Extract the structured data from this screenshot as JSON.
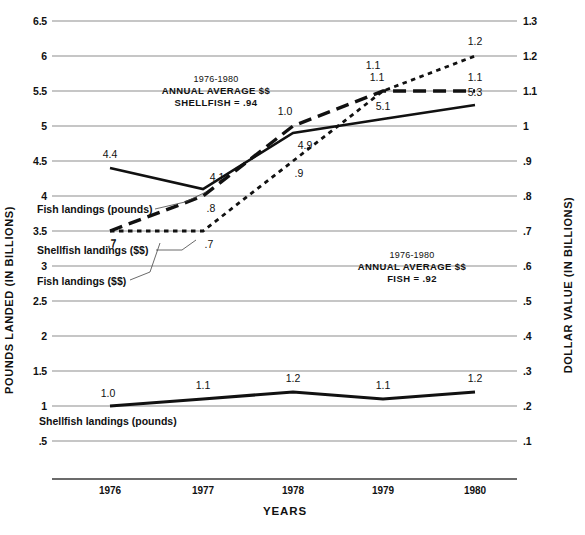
{
  "chart_data": {
    "type": "line",
    "title": "",
    "xlabel": "YEARS",
    "ylabel": "POUNDS LANDED (IN BILLIONS)",
    "ylabel_right": "DOLLAR VALUE (IN BILLIONS)",
    "categories": [
      "1976",
      "1977",
      "1978",
      "1979",
      "1980"
    ],
    "x": [
      1976,
      1977,
      1978,
      1979,
      1980
    ],
    "ylim": [
      0.5,
      6.5
    ],
    "ylim_right": [
      0.1,
      1.3
    ],
    "grid": true,
    "legend": "inline-callouts",
    "yticks_left": [
      "6.5",
      "6",
      "5.5",
      "5",
      "4.5",
      "4",
      "3.5",
      "3",
      "2.5",
      "2",
      "1.5",
      "1",
      ".5"
    ],
    "yticks_right": [
      "1.3",
      "1.2",
      "1.1",
      "1",
      ".9",
      ".8",
      ".7",
      ".6",
      ".5",
      ".4",
      ".3",
      ".2",
      ".1"
    ],
    "series": [
      {
        "name": "Fish landings (pounds)",
        "axis": "left",
        "style": "solid",
        "values": [
          4.4,
          4.1,
          4.9,
          5.1,
          5.3
        ],
        "labels": [
          "4.4",
          "4.1",
          "4.9",
          "5.1",
          "5.3"
        ]
      },
      {
        "name": "Shellfish landings ($$)",
        "axis": "right",
        "style": "long-dash",
        "values": [
          0.7,
          0.8,
          1.0,
          1.1,
          1.1
        ],
        "labels": [
          ".7",
          ".8",
          "1.0",
          "1.1",
          "1.1"
        ]
      },
      {
        "name": "Fish landings ($$)",
        "axis": "right",
        "style": "short-dash",
        "values": [
          0.7,
          0.7,
          0.9,
          1.1,
          1.2
        ],
        "labels": [
          ".7",
          ".7",
          ".9",
          "1.1",
          "1.2"
        ]
      },
      {
        "name": "Shellfish landings (pounds)",
        "axis": "left",
        "style": "solid-thick",
        "values": [
          1.0,
          1.1,
          1.2,
          1.1,
          1.2
        ],
        "labels": [
          "1.0",
          "1.1",
          "1.2",
          "1.1",
          "1.2"
        ]
      }
    ],
    "annotations": [
      {
        "id": "shellfish-average",
        "line1": "1976-1980",
        "line2": "ANNUAL AVERAGE $$",
        "line3": "SHELLFISH = .94"
      },
      {
        "id": "fish-average",
        "line1": "1976-1980",
        "line2": "ANNUAL AVERAGE $$",
        "line3": "FISH = .92"
      }
    ]
  },
  "series_labels": {
    "fish_pounds": "Fish landings (pounds)",
    "shellfish_dollars": "Shellfish landings ($$)",
    "fish_dollars": "Fish landings ($$)",
    "shellfish_pounds": "Shellfish landings (pounds)"
  }
}
